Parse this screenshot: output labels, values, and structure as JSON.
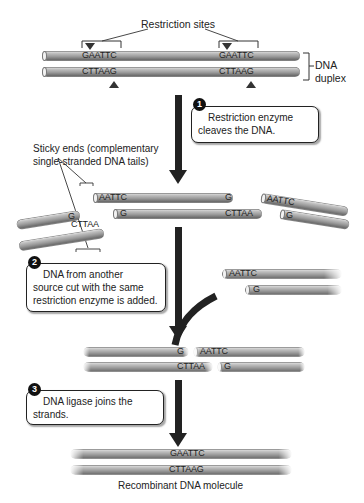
{
  "title_labels": {
    "restriction_sites": "Restriction sites",
    "dna_duplex_line1": "DNA",
    "dna_duplex_line2": "duplex",
    "sticky_ends_line1": "Sticky ends (complementary",
    "sticky_ends_line2": "single-stranded DNA tails)",
    "recombinant": "Recombinant DNA molecule"
  },
  "duplex": {
    "top_strand_sites": [
      "GAATTC",
      "GAATTC"
    ],
    "bottom_strand_sites": [
      "CTTAAG",
      "CTTAAG"
    ]
  },
  "steps": [
    {
      "number": "1",
      "line1": "Restriction enzyme",
      "line2": "cleaves the DNA."
    },
    {
      "number": "2",
      "line1": "DNA from another",
      "line2": "source cut with the same",
      "line3": "restriction enzyme is added."
    },
    {
      "number": "3",
      "line1": "DNA ligase joins the",
      "line2": "strands."
    }
  ],
  "cleaved": {
    "left_top_end": "G",
    "left_bottom_end": "CTTAA",
    "middle_top_start": "AATTC",
    "middle_top_end": "G",
    "middle_bottom_start": "G",
    "middle_bottom_end": "CTTAA",
    "right_top_start": "AATTC",
    "right_bottom_start": "G"
  },
  "foreign": {
    "top_start": "AATTC",
    "bottom_start": "G"
  },
  "annealed": {
    "top_left": "G",
    "top_right": "AATTC",
    "bottom_left": "CTTAA",
    "bottom_right": "G"
  },
  "recombinant": {
    "top": "GAATTC",
    "bottom": "CTTAAG"
  }
}
